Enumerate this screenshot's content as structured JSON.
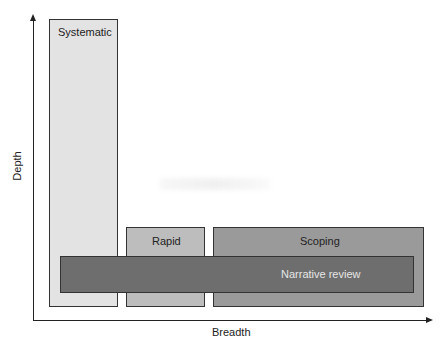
{
  "diagram": {
    "axes": {
      "y_label": "Depth",
      "x_label": "Breadth"
    },
    "boxes": [
      {
        "id": "systematic",
        "label": "Systematic",
        "color": "#e3e3e3"
      },
      {
        "id": "rapid",
        "label": "Rapid",
        "color": "#bdbdbd"
      },
      {
        "id": "scoping",
        "label": "Scoping",
        "color": "#9a9a9a"
      },
      {
        "id": "narrative",
        "label": "Narrative review",
        "color": "#6e6e6e"
      }
    ]
  }
}
